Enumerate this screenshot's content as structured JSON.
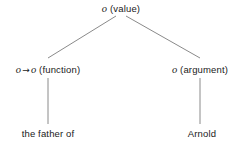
{
  "figure": {
    "name": "semantic-composition-tree",
    "background_color": "#ffffff",
    "edge_color": "#8a8a8a",
    "text_color": "#1a1a1a"
  },
  "nodes": {
    "root": {
      "id": "value",
      "type_symbol": "o",
      "role": "(value)",
      "x": 121,
      "y": 9
    },
    "function": {
      "id": "function",
      "type_symbol_left": "o",
      "arrow": "→",
      "type_symbol_right": "o",
      "role": "(function)",
      "x": 48,
      "y": 70
    },
    "argument": {
      "id": "argument",
      "type_symbol": "o",
      "role": "(argument)",
      "x": 200,
      "y": 70
    }
  },
  "leaves": {
    "function_leaf": {
      "id": "the-father-of",
      "text": "the father of",
      "x": 48,
      "y": 134
    },
    "argument_leaf": {
      "id": "arnold",
      "text": "Arnold",
      "x": 202,
      "y": 134
    }
  },
  "edges": [
    {
      "id": "root-to-function",
      "x1": 116,
      "y1": 16,
      "x2": 48,
      "y2": 58
    },
    {
      "id": "root-to-argument",
      "x1": 126,
      "y1": 16,
      "x2": 200,
      "y2": 58
    },
    {
      "id": "function-to-leaf",
      "x1": 48,
      "y1": 78,
      "x2": 48,
      "y2": 124
    },
    {
      "id": "argument-to-leaf",
      "x1": 200,
      "y1": 78,
      "x2": 200,
      "y2": 124
    }
  ]
}
